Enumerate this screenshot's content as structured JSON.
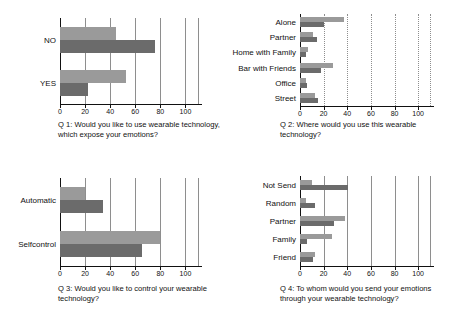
{
  "figure": {
    "background": "#ffffff",
    "light_bar_color": "#9a9a9a",
    "dark_bar_color": "#6b6b6b",
    "gridline_color": "#8e8e8e",
    "axis_color": "#111111"
  },
  "chart_data": [
    {
      "id": "q1",
      "type": "bar",
      "orientation": "horizontal",
      "title": "",
      "caption": "Q 1: Would you like to use wearable technology,\nwhich expose your emotions?",
      "categories": [
        "NO",
        "YES"
      ],
      "series": [
        {
          "name": "light",
          "color": "#9a9a9a",
          "values": [
            45,
            53
          ]
        },
        {
          "name": "dark",
          "color": "#6b6b6b",
          "values": [
            76,
            22
          ]
        }
      ],
      "xlabel": "",
      "ylabel": "",
      "xlim": [
        0,
        110
      ],
      "xticks": [
        0,
        20,
        40,
        60,
        80,
        100
      ],
      "xticklabels": [
        "0",
        "20",
        "40",
        "60",
        "80",
        "100"
      ],
      "grid": true,
      "grid_style": "solid",
      "legend": "none"
    },
    {
      "id": "q2",
      "type": "bar",
      "orientation": "horizontal",
      "title": "",
      "caption": "Q 2: Where would you use this wearable\ntechnology?",
      "categories": [
        "Alone",
        "Partner",
        "Home with Family",
        "Bar with Friends",
        "Office",
        "Street"
      ],
      "series": [
        {
          "name": "light",
          "color": "#9a9a9a",
          "values": [
            37,
            11,
            7,
            28,
            5,
            13
          ]
        },
        {
          "name": "dark",
          "color": "#6b6b6b",
          "values": [
            20,
            14,
            5,
            18,
            6,
            15
          ]
        }
      ],
      "xlabel": "",
      "ylabel": "",
      "xlim": [
        0,
        110
      ],
      "xticks": [
        0,
        20,
        40,
        60,
        80,
        100
      ],
      "xticklabels": [
        "0",
        "20",
        "40",
        "60",
        "80",
        "100"
      ],
      "grid": true,
      "grid_style": "dotted",
      "legend": "none"
    },
    {
      "id": "q3",
      "type": "bar",
      "orientation": "horizontal",
      "title": "",
      "caption": "Q 3: Would you like to control your wearable\ntechnology?",
      "categories": [
        "Automatic",
        "Selfcontrol"
      ],
      "series": [
        {
          "name": "light",
          "color": "#9a9a9a",
          "values": [
            20,
            80
          ]
        },
        {
          "name": "dark",
          "color": "#6b6b6b",
          "values": [
            34,
            65
          ]
        }
      ],
      "xlabel": "",
      "ylabel": "",
      "xlim": [
        0,
        110
      ],
      "xticks": [
        0,
        20,
        40,
        60,
        80,
        100
      ],
      "xticklabels": [
        "0",
        "20",
        "40",
        "60",
        "80",
        "100"
      ],
      "grid": true,
      "grid_style": "solid",
      "legend": "none"
    },
    {
      "id": "q4",
      "type": "bar",
      "orientation": "horizontal",
      "title": "",
      "caption": "Q 4: To whom would you send your emotions\nthrough your wearable technology?",
      "categories": [
        "Not Send",
        "Random",
        "Partner",
        "Family",
        "Friend"
      ],
      "series": [
        {
          "name": "light",
          "color": "#9a9a9a",
          "values": [
            10,
            5,
            38,
            27,
            13
          ]
        },
        {
          "name": "dark",
          "color": "#6b6b6b",
          "values": [
            41,
            13,
            29,
            6,
            11
          ]
        }
      ],
      "xlabel": "",
      "ylabel": "",
      "xlim": [
        0,
        110
      ],
      "xticks": [
        0,
        20,
        40,
        60,
        80,
        100
      ],
      "xticklabels": [
        "0",
        "20",
        "40",
        "60",
        "80",
        "100"
      ],
      "grid": true,
      "grid_style": "solid",
      "legend": "none"
    }
  ]
}
